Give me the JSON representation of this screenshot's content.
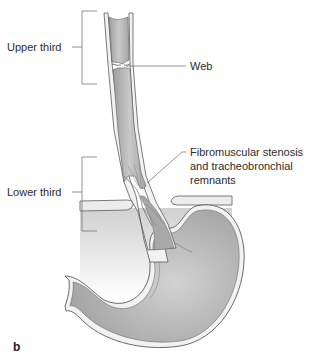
{
  "figure": {
    "panel_label": "b",
    "labels": {
      "upper_third": "Upper third",
      "lower_third": "Lower third",
      "web": "Web",
      "stenosis_line1": "Fibromuscular stenosis",
      "stenosis_line2": "and tracheobronchial",
      "stenosis_line3": "remnants"
    },
    "colors": {
      "tissue_fill": "#b3b3b3",
      "tissue_light": "#d9d9d9",
      "wall": "#f2f2f2",
      "outline": "#5a5a5a",
      "diaphragm_shade": "#d4d4d4",
      "label_text": "#2b2b2b",
      "leader_line": "#666666"
    }
  }
}
